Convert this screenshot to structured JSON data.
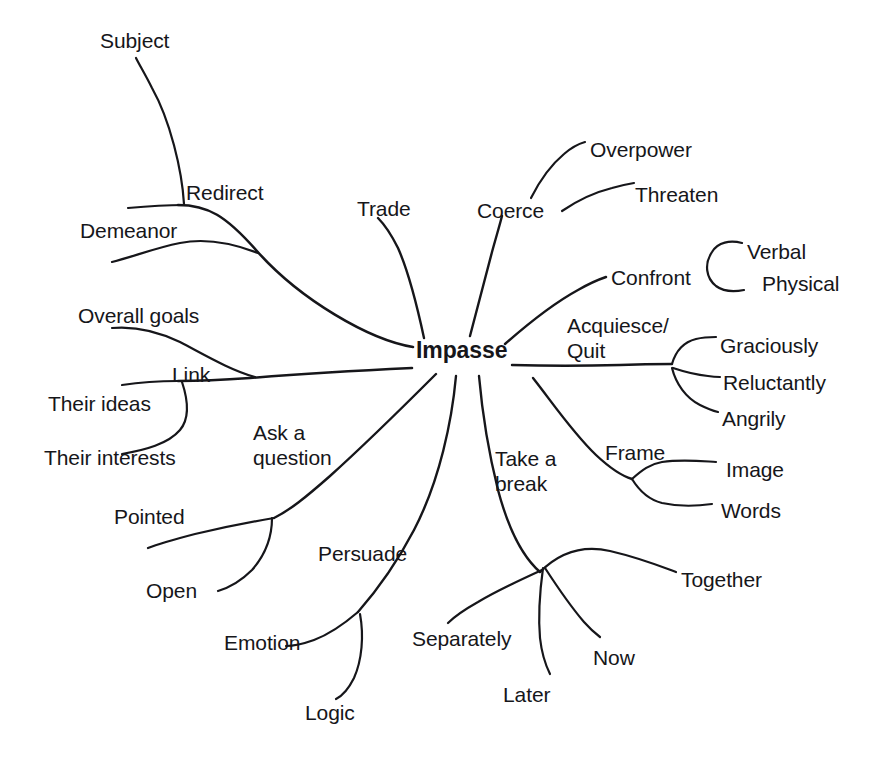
{
  "diagram": {
    "type": "mind-map",
    "title": "Impasse",
    "root": {
      "label": "Impasse",
      "x": 416,
      "y": 338
    },
    "nodes": [
      {
        "id": "redirect",
        "label": "Redirect",
        "x": 186,
        "y": 180,
        "level": 1
      },
      {
        "id": "subject",
        "label": "Subject",
        "x": 100,
        "y": 28,
        "level": 2,
        "parent": "redirect"
      },
      {
        "id": "demeanor",
        "label": "Demeanor",
        "x": 80,
        "y": 218,
        "level": 2,
        "parent": "redirect"
      },
      {
        "id": "link",
        "label": "Link",
        "x": 172,
        "y": 362,
        "level": 1
      },
      {
        "id": "overall-goals",
        "label": "Overall goals",
        "x": 78,
        "y": 303,
        "level": 2,
        "parent": "link"
      },
      {
        "id": "their-ideas",
        "label": "Their ideas",
        "x": 48,
        "y": 391,
        "level": 2,
        "parent": "link"
      },
      {
        "id": "their-interests",
        "label": "Their interests",
        "x": 44,
        "y": 445,
        "level": 2,
        "parent": "link"
      },
      {
        "id": "trade",
        "label": "Trade",
        "x": 357,
        "y": 196,
        "level": 1
      },
      {
        "id": "coerce",
        "label": "Coerce",
        "x": 477,
        "y": 198,
        "level": 1
      },
      {
        "id": "overpower",
        "label": "Overpower",
        "x": 590,
        "y": 137,
        "level": 2,
        "parent": "coerce"
      },
      {
        "id": "threaten",
        "label": "Threaten",
        "x": 635,
        "y": 182,
        "level": 2,
        "parent": "coerce"
      },
      {
        "id": "confront",
        "label": "Confront",
        "x": 611,
        "y": 265,
        "level": 1
      },
      {
        "id": "verbal",
        "label": "Verbal",
        "x": 747,
        "y": 239,
        "level": 2,
        "parent": "confront"
      },
      {
        "id": "physical",
        "label": "Physical",
        "x": 762,
        "y": 271,
        "level": 2,
        "parent": "confront"
      },
      {
        "id": "acquiesce-quit",
        "label": "Acquiesce/\nQuit",
        "x": 567,
        "y": 313,
        "level": 1
      },
      {
        "id": "graciously",
        "label": "Graciously",
        "x": 720,
        "y": 333,
        "level": 2,
        "parent": "acquiesce-quit"
      },
      {
        "id": "reluctantly",
        "label": "Reluctantly",
        "x": 723,
        "y": 370,
        "level": 2,
        "parent": "acquiesce-quit"
      },
      {
        "id": "angrily",
        "label": "Angrily",
        "x": 722,
        "y": 406,
        "level": 2,
        "parent": "acquiesce-quit"
      },
      {
        "id": "frame",
        "label": "Frame",
        "x": 605,
        "y": 440,
        "level": 1
      },
      {
        "id": "image",
        "label": "Image",
        "x": 726,
        "y": 457,
        "level": 2,
        "parent": "frame"
      },
      {
        "id": "words",
        "label": "Words",
        "x": 721,
        "y": 498,
        "level": 2,
        "parent": "frame"
      },
      {
        "id": "take-a-break",
        "label": "Take a\nbreak",
        "x": 495,
        "y": 446,
        "level": 1
      },
      {
        "id": "together",
        "label": "Together",
        "x": 681,
        "y": 567,
        "level": 2,
        "parent": "take-a-break"
      },
      {
        "id": "separately",
        "label": "Separately",
        "x": 412,
        "y": 626,
        "level": 2,
        "parent": "take-a-break"
      },
      {
        "id": "later",
        "label": "Later",
        "x": 503,
        "y": 682,
        "level": 2,
        "parent": "take-a-break"
      },
      {
        "id": "now",
        "label": "Now",
        "x": 593,
        "y": 645,
        "level": 2,
        "parent": "take-a-break"
      },
      {
        "id": "ask-a-question",
        "label": "Ask a\nquestion",
        "x": 253,
        "y": 420,
        "level": 1
      },
      {
        "id": "pointed",
        "label": "Pointed",
        "x": 114,
        "y": 504,
        "level": 2,
        "parent": "ask-a-question"
      },
      {
        "id": "open",
        "label": "Open",
        "x": 146,
        "y": 578,
        "level": 2,
        "parent": "ask-a-question"
      },
      {
        "id": "persuade",
        "label": "Persuade",
        "x": 318,
        "y": 541,
        "level": 1
      },
      {
        "id": "emotion",
        "label": "Emotion",
        "x": 224,
        "y": 630,
        "level": 2,
        "parent": "persuade"
      },
      {
        "id": "logic",
        "label": "Logic",
        "x": 305,
        "y": 700,
        "level": 2,
        "parent": "persuade"
      }
    ],
    "style": {
      "stroke_color": "#16161a",
      "background": "#ffffff",
      "text_color": "#16161a"
    }
  }
}
